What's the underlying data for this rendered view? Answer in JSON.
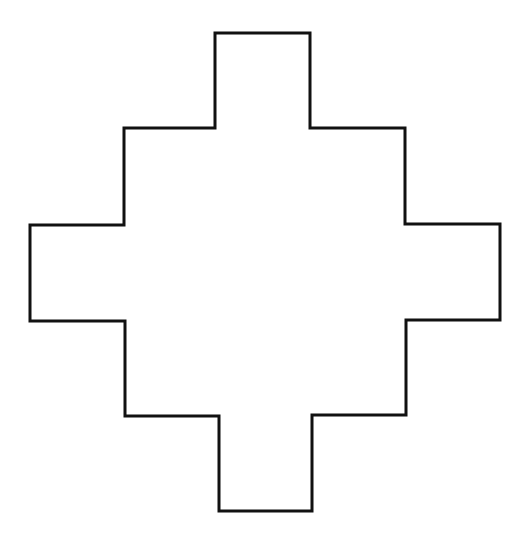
{
  "figure": {
    "width": 527,
    "height": 543,
    "background": "#ffffff",
    "stroke_color": "#111111",
    "stroke_width": 3,
    "outline_points": "215,33 310,33 310,128 405,128 405,224 500,224 500,320 406,320 406,415 312,415 312,511 219,511 219,416 125,416 125,321 30,321 30,225 124,225 124,128 215,128"
  }
}
